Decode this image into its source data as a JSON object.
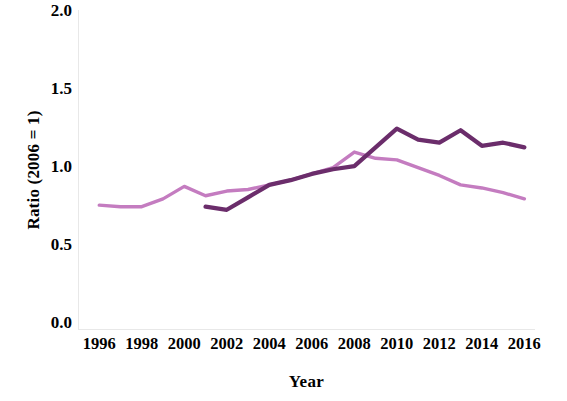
{
  "chart_data": {
    "type": "line",
    "title": "",
    "xlabel": "Year",
    "ylabel": "Ratio (2006 = 1)",
    "xlim": [
      1995,
      2016.5
    ],
    "ylim": [
      0.0,
      2.05
    ],
    "xticks": [
      1996,
      1998,
      2000,
      2002,
      2004,
      2006,
      2008,
      2010,
      2012,
      2014,
      2016
    ],
    "yticks": [
      "0.0",
      "0.5",
      "1.0",
      "1.5",
      "2.0"
    ],
    "ytick_values": [
      0.0,
      0.5,
      1.0,
      1.5,
      2.0
    ],
    "grid": false,
    "legend": "none",
    "series": [
      {
        "name": "light-purple-series",
        "color": "#c47cc0",
        "x": [
          1996,
          1997,
          1998,
          1999,
          2000,
          2001,
          2002,
          2003,
          2004,
          2005,
          2006,
          2007,
          2008,
          2009,
          2010,
          2011,
          2012,
          2013,
          2014,
          2015,
          2016
        ],
        "values": [
          0.8,
          0.79,
          0.79,
          0.84,
          0.92,
          0.86,
          0.89,
          0.9,
          0.93,
          0.96,
          1.0,
          1.04,
          1.14,
          1.1,
          1.09,
          1.04,
          0.99,
          0.93,
          0.91,
          0.88,
          0.84
        ]
      },
      {
        "name": "dark-purple-series",
        "color": "#6b2d6b",
        "x": [
          2001,
          2002,
          2003,
          2004,
          2005,
          2006,
          2007,
          2008,
          2009,
          2010,
          2011,
          2012,
          2013,
          2014,
          2015,
          2016
        ],
        "values": [
          0.79,
          0.77,
          0.85,
          0.93,
          0.96,
          1.0,
          1.03,
          1.05,
          1.17,
          1.29,
          1.22,
          1.2,
          1.28,
          1.18,
          1.2,
          1.17
        ]
      }
    ]
  }
}
